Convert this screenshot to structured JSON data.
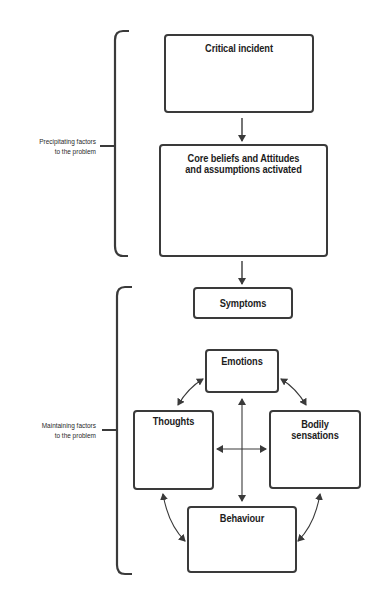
{
  "diagram": {
    "type": "cognitive-behavioural-model",
    "groups": [
      {
        "id": "precipitating",
        "label_line1": "Precipitating factors",
        "label_line2": "to the problem"
      },
      {
        "id": "maintaining",
        "label_line1": "Maintaining factors",
        "label_line2": "to the problem"
      }
    ],
    "nodes": {
      "critical_incident": "Critical incident",
      "core_beliefs_line1": "Core beliefs and Attitudes",
      "core_beliefs_line2": "and assumptions activated",
      "symptoms": "Symptoms",
      "emotions": "Emotions",
      "thoughts": "Thoughts",
      "bodily_line1": "Bodily",
      "bodily_line2": "sensations",
      "behaviour": "Behaviour"
    },
    "edges": [
      {
        "from": "Critical incident",
        "to": "Core beliefs and Attitudes and assumptions activated",
        "type": "one-way"
      },
      {
        "from": "Core beliefs and Attitudes and assumptions activated",
        "to": "Symptoms",
        "type": "one-way"
      },
      {
        "from": "Emotions",
        "to": "Thoughts",
        "type": "two-way"
      },
      {
        "from": "Emotions",
        "to": "Bodily sensations",
        "type": "two-way"
      },
      {
        "from": "Emotions",
        "to": "Behaviour",
        "type": "two-way"
      },
      {
        "from": "Thoughts",
        "to": "Bodily sensations",
        "type": "two-way"
      },
      {
        "from": "Thoughts",
        "to": "Behaviour",
        "type": "two-way"
      },
      {
        "from": "Bodily sensations",
        "to": "Behaviour",
        "type": "two-way"
      }
    ],
    "colors": {
      "stroke": "#3a3a3a",
      "text": "#1c1c1c",
      "background": "#ffffff"
    }
  }
}
